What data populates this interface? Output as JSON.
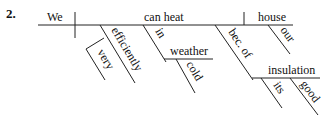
{
  "diagram": {
    "number": "2.",
    "subject": "We",
    "verb": "can heat",
    "object": "house",
    "modifiers": {
      "efficiently": "efficiently",
      "very": "very",
      "in": "in",
      "weather": "weather",
      "cold": "cold",
      "our": "our",
      "because_of": "bec. of",
      "insulation": "insulation",
      "its": "its",
      "good": "good"
    }
  }
}
